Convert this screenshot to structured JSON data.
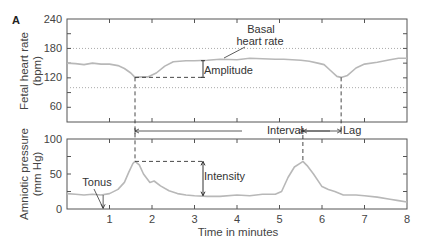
{
  "figure": {
    "panel_letter": "A",
    "x_axis_label": "Time in minutes"
  },
  "colors": {
    "trace": "#b8b8b8",
    "axis": "#555555",
    "annotation": "#333333",
    "reference_dotted": "#aaaaaa"
  },
  "annotations": {
    "basal": "Basal",
    "heart_rate": "heart rate",
    "amplitude": "Amplitude",
    "interval": "Interval",
    "lag": "Lag",
    "intensity": "Intensity",
    "tonus": "Tonus"
  },
  "chart_data": [
    {
      "type": "line",
      "title": "",
      "xlabel": "",
      "ylabel": "Fetal heart rate (bpm)",
      "ylabel_lines": [
        "Fetal heart rate",
        "(bpm)"
      ],
      "xlim": [
        0,
        8
      ],
      "ylim": [
        30,
        240
      ],
      "yticks": [
        60,
        120,
        180,
        240
      ],
      "ytick_labels": [
        "60",
        "120",
        "180",
        "240"
      ],
      "reference_lines_dotted": [
        180,
        100
      ],
      "grid": false,
      "series": [
        {
          "name": "Fetal heart rate",
          "x": [
            0,
            0.2,
            0.4,
            0.6,
            0.8,
            1.0,
            1.2,
            1.35,
            1.5,
            1.6,
            1.75,
            1.9,
            2.1,
            2.3,
            2.5,
            2.8,
            3.0,
            3.3,
            3.6,
            4.0,
            4.3,
            4.6,
            4.9,
            5.1,
            5.3,
            5.5,
            5.7,
            5.9,
            6.05,
            6.2,
            6.35,
            6.45,
            6.6,
            6.8,
            7.0,
            7.3,
            7.6,
            7.8,
            8.0
          ],
          "y": [
            150,
            149,
            147,
            150,
            148,
            148,
            145,
            139,
            130,
            121,
            122,
            122,
            130,
            144,
            153,
            155,
            155,
            156,
            158,
            157,
            160,
            159,
            158,
            158,
            157,
            156,
            154,
            150,
            147,
            135,
            123,
            121,
            125,
            140,
            148,
            152,
            157,
            160,
            160
          ]
        }
      ]
    },
    {
      "type": "line",
      "title": "",
      "xlabel": "Time in minutes",
      "ylabel": "Amniotic pressure (mm Hg)",
      "ylabel_lines": [
        "Amniotic pressure",
        "(mm Hg)"
      ],
      "xlim": [
        0,
        8
      ],
      "ylim": [
        0,
        100
      ],
      "xticks": [
        1,
        2,
        3,
        4,
        5,
        6,
        7,
        8
      ],
      "xtick_labels": [
        "1",
        "2",
        "3",
        "4",
        "5",
        "6",
        "7",
        "8"
      ],
      "yticks": [
        0,
        50,
        100
      ],
      "ytick_labels": [
        "0",
        "50",
        "100"
      ],
      "grid": false,
      "series": [
        {
          "name": "Amniotic pressure",
          "x": [
            0,
            0.2,
            0.4,
            0.6,
            0.8,
            1.0,
            1.2,
            1.35,
            1.45,
            1.55,
            1.6,
            1.7,
            1.8,
            1.95,
            2.05,
            2.2,
            2.4,
            2.6,
            2.8,
            3.0,
            3.3,
            3.6,
            4.0,
            4.3,
            4.6,
            4.9,
            5.05,
            5.2,
            5.35,
            5.5,
            5.55,
            5.65,
            5.8,
            6.0,
            6.15,
            6.3,
            6.5,
            6.8,
            7.0,
            7.3,
            7.6,
            7.8,
            8.0
          ],
          "y": [
            22,
            21,
            20,
            21,
            20,
            22,
            28,
            38,
            52,
            65,
            68,
            63,
            50,
            38,
            40,
            33,
            26,
            22,
            20,
            19,
            18,
            18,
            20,
            19,
            21,
            21,
            25,
            45,
            60,
            66,
            68,
            62,
            50,
            32,
            28,
            25,
            20,
            20,
            19,
            17,
            14,
            12,
            10
          ]
        }
      ]
    }
  ]
}
